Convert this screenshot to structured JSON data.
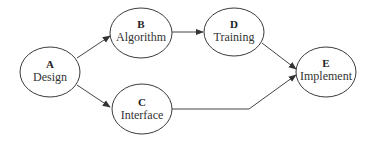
{
  "diagram": {
    "type": "flowchart",
    "nodes": [
      {
        "id": "A",
        "label": "Design",
        "cx": 50,
        "cy": 72
      },
      {
        "id": "B",
        "label": "Algorithm",
        "cx": 141,
        "cy": 33
      },
      {
        "id": "C",
        "label": "Interface",
        "cx": 142,
        "cy": 109
      },
      {
        "id": "D",
        "label": "Training",
        "cx": 234,
        "cy": 32
      },
      {
        "id": "E",
        "label": "Implement",
        "cx": 326,
        "cy": 72
      }
    ],
    "edges": [
      {
        "from": "A",
        "to": "B"
      },
      {
        "from": "A",
        "to": "C"
      },
      {
        "from": "B",
        "to": "D"
      },
      {
        "from": "D",
        "to": "E"
      },
      {
        "from": "C",
        "to": "E"
      }
    ],
    "colors": {
      "stroke": "#3a3a3a",
      "text": "#333333",
      "background": "#ffffff"
    }
  }
}
